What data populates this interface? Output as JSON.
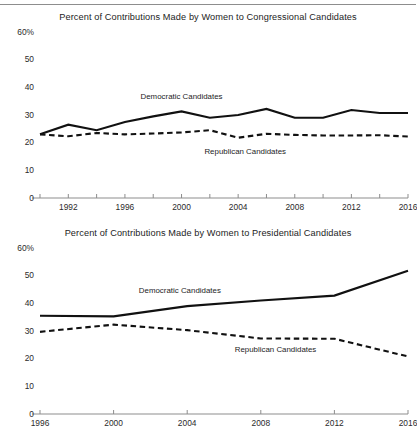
{
  "figure": {
    "top_rule": true,
    "background": "#ffffff",
    "ink_color": "#111111",
    "axis_color": "#8d8d8d"
  },
  "chart_data": [
    {
      "type": "line",
      "title": "Percent of Contributions Made by Women to Congressional Candidates",
      "xlabel": "",
      "ylabel": "",
      "ylim": [
        0,
        60
      ],
      "xlim": [
        1990,
        2016
      ],
      "grid": false,
      "legend_position": "inline-annotation",
      "ytick_labels": [
        "60%",
        "50",
        "40",
        "30",
        "20",
        "10",
        "0"
      ],
      "ytick_values": [
        60,
        50,
        40,
        30,
        20,
        10,
        0
      ],
      "xtick_labels": [
        "1992",
        "1996",
        "2000",
        "2004",
        "2008",
        "2012",
        "2016"
      ],
      "xtick_values": [
        1992,
        1996,
        2000,
        2004,
        2008,
        2012,
        2016
      ],
      "minor_xticks": [
        1990,
        1992,
        1994,
        1996,
        1998,
        2000,
        2002,
        2004,
        2006,
        2008,
        2010,
        2012,
        2014,
        2016
      ],
      "x": [
        1990,
        1992,
        1994,
        1996,
        1998,
        2000,
        2002,
        2004,
        2006,
        2008,
        2010,
        2012,
        2014,
        2016
      ],
      "series": [
        {
          "name": "Democratic Candidates",
          "style": "solid",
          "color": "#111111",
          "values": [
            23.0,
            26.5,
            24.5,
            27.5,
            29.5,
            31.3,
            29.0,
            30.0,
            32.2,
            29.0,
            29.0,
            31.8,
            30.7,
            30.7
          ],
          "annotation": "Democratic Candidates",
          "annotation_x": 2000,
          "annotation_y": 36.5
        },
        {
          "name": "Republican Candidates",
          "style": "dashed",
          "color": "#111111",
          "values": [
            23.0,
            22.3,
            23.5,
            23.0,
            23.3,
            23.7,
            24.5,
            21.8,
            23.2,
            22.8,
            22.6,
            22.6,
            22.7,
            22.2
          ],
          "annotation": "Republican Candidates",
          "annotation_x": 2004.5,
          "annotation_y": 16.8
        }
      ]
    },
    {
      "type": "line",
      "title": "Percent of Contributions Made by Women to Presidential Candidates",
      "xlabel": "",
      "ylabel": "",
      "ylim": [
        0,
        60
      ],
      "xlim": [
        1996,
        2016
      ],
      "grid": false,
      "legend_position": "inline-annotation",
      "ytick_labels": [
        "60%",
        "50",
        "40",
        "30",
        "20",
        "10",
        "0"
      ],
      "ytick_values": [
        60,
        50,
        40,
        30,
        20,
        10,
        0
      ],
      "xtick_labels": [
        "1996",
        "2000",
        "2004",
        "2008",
        "2012",
        "2016"
      ],
      "xtick_values": [
        1996,
        2000,
        2004,
        2008,
        2012,
        2016
      ],
      "minor_xticks": [
        1996,
        2000,
        2004,
        2008,
        2012,
        2016
      ],
      "x": [
        1996,
        2000,
        2004,
        2008,
        2012,
        2016
      ],
      "series": [
        {
          "name": "Democratic Candidates",
          "style": "solid",
          "color": "#111111",
          "values": [
            35.5,
            35.3,
            39.0,
            41.0,
            42.8,
            51.8
          ],
          "annotation": "Democratic Candidates",
          "annotation_x": 2003.6,
          "annotation_y": 44.6
        },
        {
          "name": "Republican Candidates",
          "style": "dashed",
          "color": "#111111",
          "values": [
            29.7,
            32.3,
            30.3,
            27.3,
            27.2,
            20.8
          ],
          "annotation": "Republican Candidates",
          "annotation_x": 2008.8,
          "annotation_y": 23.0
        }
      ]
    }
  ]
}
